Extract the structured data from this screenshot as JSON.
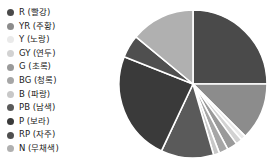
{
  "legend": {
    "position": "left",
    "items": [
      {
        "code": "R",
        "label": "R  (빨강)",
        "color": "#4a4a4a"
      },
      {
        "code": "YR",
        "label": "YR  (주황)",
        "color": "#8c8c8c"
      },
      {
        "code": "Y",
        "label": "Y  (노랑)",
        "color": "#eaeaea"
      },
      {
        "code": "GY",
        "label": "GY  (연두)",
        "color": "#d2d2d2"
      },
      {
        "code": "G",
        "label": "G  (초록)",
        "color": "#9a9a9a"
      },
      {
        "code": "BG",
        "label": "BG  (청록)",
        "color": "#a6a6a6"
      },
      {
        "code": "B",
        "label": "B  (파랑)",
        "color": "#c8c8c8"
      },
      {
        "code": "PB",
        "label": "PB  (남색)",
        "color": "#5a5a5a"
      },
      {
        "code": "P",
        "label": "P  (보라)",
        "color": "#3a3a3a"
      },
      {
        "code": "RP",
        "label": "RP  (자주)",
        "color": "#4f4f4f"
      },
      {
        "code": "N",
        "label": "N  (무채색)",
        "color": "#b0b0b0"
      }
    ]
  },
  "chart_data": {
    "type": "pie",
    "title": "",
    "start_angle": 0,
    "direction": "clockwise",
    "center": {
      "x": 83,
      "y": 84
    },
    "radius": 74,
    "wedge_gap_color": "#ffffff",
    "categories": [
      "R (빨강)",
      "YR (주황)",
      "Y (노랑)",
      "GY (연두)",
      "G (초록)",
      "BG (청록)",
      "B (파랑)",
      "PB (남색)",
      "P (보라)",
      "RP (자주)",
      "N (무채색)"
    ],
    "values": [
      25.0,
      12.5,
      1.1,
      1.4,
      2.2,
      2.0,
      1.3,
      11.5,
      24.0,
      5.0,
      14.0
    ],
    "colors": [
      "#4a4a4a",
      "#8c8c8c",
      "#eaeaea",
      "#d2d2d2",
      "#9a9a9a",
      "#a6a6a6",
      "#c8c8c8",
      "#5a5a5a",
      "#3a3a3a",
      "#4f4f4f",
      "#b0b0b0"
    ],
    "xlabel": "",
    "ylabel": "",
    "legend_position": "left",
    "grid": false
  }
}
